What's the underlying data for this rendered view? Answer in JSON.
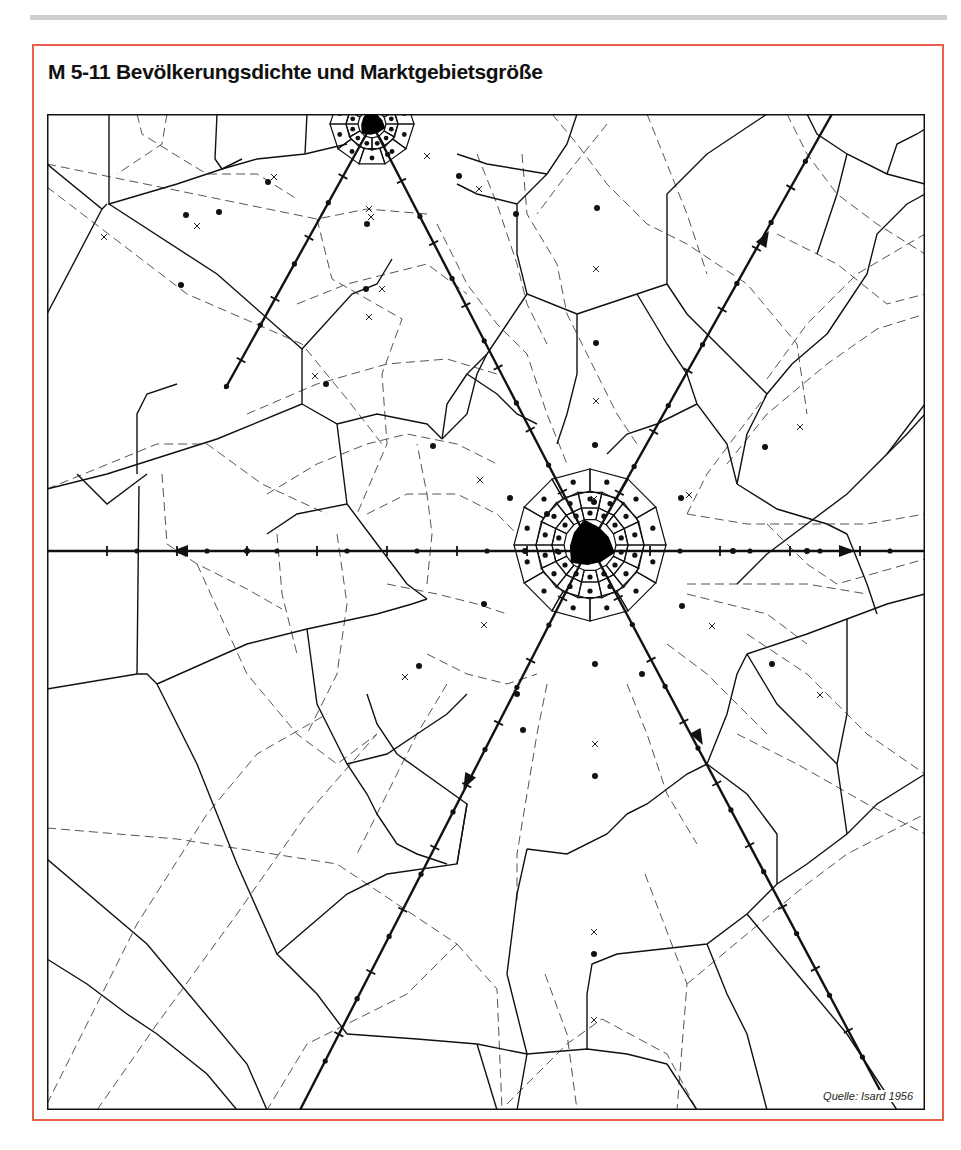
{
  "page": {
    "rule_color": "#cfcfcf"
  },
  "figure": {
    "title": "M 5-11 Bevölkerungsdichte und Marktgebietsgröße",
    "source": "Quelle: Isard 1956",
    "frame_color": "#e8604a"
  },
  "map": {
    "width": 878,
    "height": 996,
    "cities": [
      {
        "name": "central-metropolis",
        "x": 543,
        "y": 431,
        "r": 26
      },
      {
        "name": "northern-city",
        "x": 325,
        "y": 10,
        "r": 14
      }
    ],
    "transport_lines": [
      {
        "name": "west-route",
        "from": [
          0,
          437
        ],
        "to": [
          543,
          437
        ],
        "arrow_at": [
          133,
          437
        ],
        "arrow_dir": "west"
      },
      {
        "name": "east-route",
        "from": [
          543,
          437
        ],
        "to": [
          878,
          437
        ],
        "arrow_at": [
          800,
          437
        ],
        "arrow_dir": "east"
      },
      {
        "name": "northeast-route",
        "from": [
          543,
          431
        ],
        "to": [
          785,
          0
        ],
        "arrow_at": [
          718,
          124
        ],
        "arrow_dir": "northeast"
      },
      {
        "name": "southwest-route",
        "from": [
          543,
          431
        ],
        "to": [
          253,
          996
        ],
        "arrow_at": [
          420,
          668
        ],
        "arrow_dir": "southwest"
      },
      {
        "name": "southeast-route",
        "from": [
          543,
          431
        ],
        "to": [
          835,
          980
        ],
        "arrow_at": [
          652,
          624
        ],
        "arrow_dir": "southeast"
      },
      {
        "name": "north-link-route",
        "from": [
          543,
          431
        ],
        "to": [
          325,
          10
        ]
      },
      {
        "name": "northwest-route",
        "from": [
          325,
          10
        ],
        "to": [
          178,
          275
        ]
      }
    ],
    "legend": {
      "solid_line": "market area boundary",
      "dashed_line": "alternative boundary",
      "dot": "center",
      "cross": "alternative center"
    }
  }
}
